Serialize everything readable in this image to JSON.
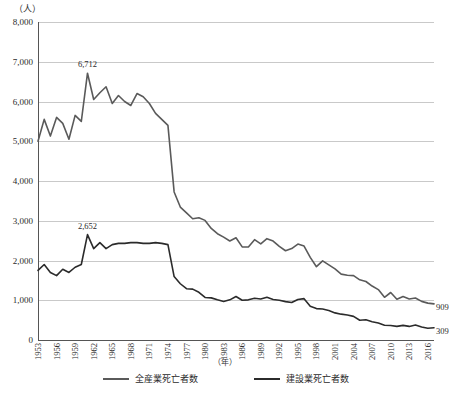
{
  "chart_data": {
    "type": "line",
    "title": "",
    "xlabel": "（年）",
    "ylabel": "（人）",
    "ylim": [
      0,
      8000
    ],
    "ytick_labels": [
      "0",
      "1,000",
      "2,000",
      "3,000",
      "4,000",
      "5,000",
      "6,000",
      "7,000",
      "8,000"
    ],
    "ytick_values": [
      0,
      1000,
      2000,
      3000,
      4000,
      5000,
      6000,
      7000,
      8000
    ],
    "xtick_labels": [
      "1953",
      "1956",
      "1959",
      "1962",
      "1965",
      "1968",
      "1971",
      "1974",
      "1977",
      "1980",
      "1983",
      "1986",
      "1989",
      "1992",
      "1995",
      "1998",
      "2001",
      "2004",
      "2007",
      "2010",
      "2013",
      "2016"
    ],
    "xlim": [
      1953,
      2017
    ],
    "grid": true,
    "legend_position": "bottom",
    "x": [
      1953,
      1954,
      1955,
      1956,
      1957,
      1958,
      1959,
      1960,
      1961,
      1962,
      1963,
      1964,
      1965,
      1966,
      1967,
      1968,
      1969,
      1970,
      1971,
      1972,
      1973,
      1974,
      1975,
      1976,
      1977,
      1978,
      1979,
      1980,
      1981,
      1982,
      1983,
      1984,
      1985,
      1986,
      1987,
      1988,
      1989,
      1990,
      1991,
      1992,
      1993,
      1994,
      1995,
      1996,
      1997,
      1998,
      1999,
      2000,
      2001,
      2002,
      2003,
      2004,
      2005,
      2006,
      2007,
      2008,
      2009,
      2010,
      2011,
      2012,
      2013,
      2014,
      2015,
      2016,
      2017
    ],
    "series": [
      {
        "name": "全産業死亡者数",
        "color": "#5a5a5a",
        "annotation_peak": {
          "label": "6,712",
          "x": 1961,
          "y": 6712
        },
        "annotation_end": {
          "label": "909",
          "x": 2017,
          "y": 909
        },
        "values": [
          5000,
          5550,
          5130,
          5600,
          5450,
          5050,
          5650,
          5500,
          6712,
          6050,
          6220,
          6370,
          5950,
          6150,
          6000,
          5900,
          6200,
          6120,
          5950,
          5700,
          5550,
          5400,
          3725,
          3345,
          3200,
          3050,
          3077,
          3009,
          2806,
          2674,
          2588,
          2491,
          2572,
          2342,
          2338,
          2524,
          2419,
          2550,
          2489,
          2354,
          2245,
          2301,
          2414,
          2363,
          2078,
          1844,
          1992,
          1889,
          1790,
          1658,
          1628,
          1620,
          1514,
          1472,
          1357,
          1268,
          1075,
          1195,
          1024,
          1093,
          1030,
          1057,
          972,
          928,
          909
        ]
      },
      {
        "name": "建設業死亡者数",
        "color": "#2b2b2b",
        "annotation_peak": {
          "label": "2,652",
          "x": 1961,
          "y": 2652
        },
        "annotation_end": {
          "label": "309",
          "x": 2017,
          "y": 309
        },
        "values": [
          1750,
          1900,
          1700,
          1620,
          1780,
          1700,
          1830,
          1900,
          2652,
          2300,
          2450,
          2300,
          2400,
          2430,
          2430,
          2450,
          2450,
          2430,
          2430,
          2450,
          2430,
          2400,
          1595,
          1415,
          1290,
          1280,
          1200,
          1070,
          1060,
          1010,
          970,
          1010,
          1095,
          1000,
          1010,
          1050,
          1030,
          1075,
          1020,
          1000,
          965,
          942,
          1021,
          1040,
          848,
          790,
          780,
          740,
          682,
          650,
          628,
          594,
          497,
          508,
          461,
          430,
          371,
          365,
          342,
          367,
          342,
          377,
          327,
          294,
          309
        ]
      }
    ]
  },
  "annotations": {
    "unit_y": "（人）",
    "unit_x": "（年）"
  },
  "legend": {
    "items": [
      {
        "label": "全産業死亡者数",
        "color": "#5a5a5a"
      },
      {
        "label": "建設業死亡者数",
        "color": "#2b2b2b"
      }
    ]
  }
}
